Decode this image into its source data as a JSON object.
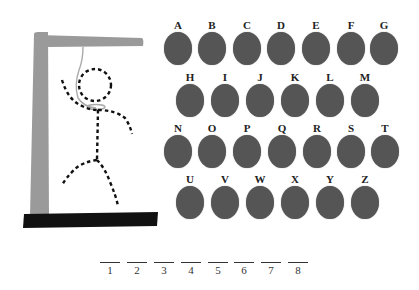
{
  "game": {
    "name": "hangman",
    "colors": {
      "gallows": "#9a9a9a",
      "base": "#111111",
      "rope": "#aaaaaa",
      "figure": "#111111",
      "letter_disc": "#555555",
      "letter_label": "#222222"
    },
    "letters": [
      {
        "label": "A",
        "x": 163,
        "y": 19
      },
      {
        "label": "B",
        "x": 197,
        "y": 19
      },
      {
        "label": "C",
        "x": 232,
        "y": 19
      },
      {
        "label": "D",
        "x": 266,
        "y": 19
      },
      {
        "label": "E",
        "x": 301,
        "y": 19
      },
      {
        "label": "F",
        "x": 336,
        "y": 19
      },
      {
        "label": "G",
        "x": 369,
        "y": 19
      },
      {
        "label": "H",
        "x": 175,
        "y": 71
      },
      {
        "label": "I",
        "x": 210,
        "y": 71
      },
      {
        "label": "J",
        "x": 245,
        "y": 71
      },
      {
        "label": "K",
        "x": 280,
        "y": 71
      },
      {
        "label": "L",
        "x": 315,
        "y": 71
      },
      {
        "label": "M",
        "x": 350,
        "y": 71
      },
      {
        "label": "N",
        "x": 163,
        "y": 122
      },
      {
        "label": "O",
        "x": 197,
        "y": 122
      },
      {
        "label": "P",
        "x": 232,
        "y": 122
      },
      {
        "label": "Q",
        "x": 267,
        "y": 122
      },
      {
        "label": "R",
        "x": 302,
        "y": 122
      },
      {
        "label": "S",
        "x": 336,
        "y": 122
      },
      {
        "label": "T",
        "x": 370,
        "y": 122
      },
      {
        "label": "U",
        "x": 175,
        "y": 173
      },
      {
        "label": "V",
        "x": 210,
        "y": 173
      },
      {
        "label": "W",
        "x": 245,
        "y": 173
      },
      {
        "label": "X",
        "x": 280,
        "y": 173
      },
      {
        "label": "Y",
        "x": 315,
        "y": 173
      },
      {
        "label": "Z",
        "x": 350,
        "y": 173
      }
    ],
    "word_slots": [
      {
        "number": "1",
        "x": 100,
        "y": 262
      },
      {
        "number": "2",
        "x": 127,
        "y": 262
      },
      {
        "number": "3",
        "x": 154,
        "y": 262
      },
      {
        "number": "4",
        "x": 181,
        "y": 262
      },
      {
        "number": "5",
        "x": 208,
        "y": 262
      },
      {
        "number": "6",
        "x": 234,
        "y": 262
      },
      {
        "number": "7",
        "x": 261,
        "y": 262
      },
      {
        "number": "8",
        "x": 288,
        "y": 262
      }
    ]
  }
}
